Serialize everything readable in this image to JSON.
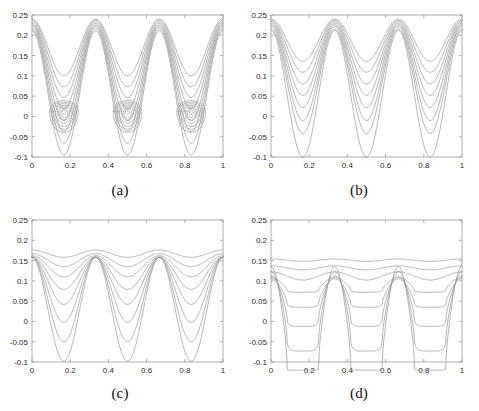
{
  "figure": {
    "title": "",
    "background_color": "#ffffff",
    "curve_color": "#8d8d8d",
    "axis_color": "#9a9a9a"
  },
  "panels": [
    {
      "id": "panel-a",
      "caption": "(a)",
      "x": 0,
      "y": 0,
      "w": 240,
      "h": 206
    },
    {
      "id": "panel-b",
      "caption": "(b)",
      "x": 239,
      "y": 0,
      "w": 240,
      "h": 206
    },
    {
      "id": "panel-c",
      "caption": "(c)",
      "x": 0,
      "y": 205,
      "w": 240,
      "h": 206
    },
    {
      "id": "panel-d",
      "caption": "(d)",
      "x": 239,
      "y": 205,
      "w": 240,
      "h": 206
    }
  ],
  "chart_data": [
    {
      "type": "line",
      "panel": "(a)",
      "title": "",
      "xlabel": "",
      "ylabel": "",
      "xlim": [
        0,
        1
      ],
      "ylim": [
        -0.1,
        0.25
      ],
      "xticks": [
        0,
        0.2,
        0.4,
        0.6,
        0.8,
        1
      ],
      "xticklabels": [
        "0",
        "0.2",
        "0.4",
        "0.6",
        "0.8",
        "1"
      ],
      "yticks": [
        -0.1,
        -0.05,
        0,
        0.05,
        0.1,
        0.15,
        0.2,
        0.25
      ],
      "yticklabels": [
        "-0.1",
        "-0.05",
        "0",
        "0.05",
        "0.1",
        "0.15",
        "0.2",
        "0.25"
      ],
      "grid": false,
      "legend": "none",
      "description": "Family of 8 nested periodic curves (period 1/3) with maxima near 0.24 and minima descending from 0.10 to -0.10, plus an inner family of small nested arcs inside each valley centered near y=0.01",
      "series": [
        {
          "name": "k1",
          "type": "cos3",
          "baseline": 0.17,
          "amplitude": 0.07,
          "peak": 0.24,
          "trough": 0.1
        },
        {
          "name": "k2",
          "type": "cos3",
          "baseline": 0.155,
          "amplitude": 0.082,
          "peak": 0.237,
          "trough": 0.073
        },
        {
          "name": "k3",
          "type": "cos3",
          "baseline": 0.14,
          "amplitude": 0.093,
          "peak": 0.233,
          "trough": 0.047
        },
        {
          "name": "k4",
          "type": "cos3",
          "baseline": 0.124,
          "amplitude": 0.105,
          "peak": 0.229,
          "trough": 0.019
        },
        {
          "name": "k5",
          "type": "cos3",
          "baseline": 0.108,
          "amplitude": 0.117,
          "peak": 0.225,
          "trough": -0.009
        },
        {
          "name": "k6",
          "type": "cos3",
          "baseline": 0.092,
          "amplitude": 0.129,
          "peak": 0.221,
          "trough": -0.037
        },
        {
          "name": "k7",
          "type": "cos3",
          "baseline": 0.075,
          "amplitude": 0.141,
          "peak": 0.216,
          "trough": -0.066
        },
        {
          "name": "k8",
          "type": "cos3",
          "baseline": 0.058,
          "amplitude": 0.153,
          "peak": 0.211,
          "trough": -0.095
        }
      ],
      "inner_arcs": {
        "centers_x": [
          0.1667,
          0.5,
          0.8333
        ],
        "center_y": 0.012,
        "count": 7,
        "max_half_width": 0.075,
        "max_half_height": 0.03
      }
    },
    {
      "type": "line",
      "panel": "(b)",
      "title": "",
      "xlabel": "",
      "ylabel": "",
      "xlim": [
        0,
        1
      ],
      "ylim": [
        -0.1,
        0.25
      ],
      "xticks": [
        0,
        0.2,
        0.4,
        0.6,
        0.8,
        1
      ],
      "xticklabels": [
        "0",
        "0.2",
        "0.4",
        "0.6",
        "0.8",
        "1"
      ],
      "yticks": [
        -0.1,
        -0.05,
        0,
        0.05,
        0.1,
        0.15,
        0.2,
        0.25
      ],
      "yticklabels": [
        "-0.1",
        "-0.05",
        "0",
        "0.05",
        "0.1",
        "0.15",
        "0.2",
        "0.25"
      ],
      "grid": false,
      "legend": "none",
      "description": "Family of 8 nested periodic curves (period 1/3); maxima shrink slightly from 0.240 to 0.210 while minima descend from 0.135 to -0.100",
      "series": [
        {
          "name": "k1",
          "type": "cos3",
          "baseline": 0.188,
          "amplitude": 0.052,
          "peak": 0.24,
          "trough": 0.136
        },
        {
          "name": "k2",
          "type": "cos3",
          "baseline": 0.173,
          "amplitude": 0.064,
          "peak": 0.237,
          "trough": 0.109
        },
        {
          "name": "k3",
          "type": "cos3",
          "baseline": 0.157,
          "amplitude": 0.077,
          "peak": 0.234,
          "trough": 0.08
        },
        {
          "name": "k4",
          "type": "cos3",
          "baseline": 0.141,
          "amplitude": 0.089,
          "peak": 0.23,
          "trough": 0.052
        },
        {
          "name": "k5",
          "type": "cos3",
          "baseline": 0.124,
          "amplitude": 0.102,
          "peak": 0.226,
          "trough": 0.022
        },
        {
          "name": "k6",
          "type": "cos3",
          "baseline": 0.106,
          "amplitude": 0.116,
          "peak": 0.222,
          "trough": -0.01
        },
        {
          "name": "k7",
          "type": "cos3",
          "baseline": 0.087,
          "amplitude": 0.129,
          "peak": 0.216,
          "trough": -0.042
        },
        {
          "name": "k8",
          "type": "cos3",
          "baseline": 0.056,
          "amplitude": 0.156,
          "peak": 0.212,
          "trough": -0.1
        }
      ]
    },
    {
      "type": "line",
      "panel": "(c)",
      "title": "",
      "xlabel": "",
      "ylabel": "",
      "xlim": [
        0,
        1
      ],
      "ylim": [
        -0.1,
        0.25
      ],
      "xticks": [
        0,
        0.2,
        0.4,
        0.6,
        0.8,
        1
      ],
      "xticklabels": [
        "0",
        "0.2",
        "0.4",
        "0.6",
        "0.8",
        "1"
      ],
      "yticks": [
        -0.1,
        -0.05,
        0,
        0.05,
        0.1,
        0.15,
        0.2,
        0.25
      ],
      "yticklabels": [
        "-0.1",
        "-0.05",
        "0",
        "0.05",
        "0.1",
        "0.15",
        "0.2",
        "0.25"
      ],
      "grid": false,
      "legend": "none",
      "description": "Family of 8 periodic curves (period 1/3) whose amplitude grows from nearly flat at 0.168 down to a deep oscillation reaching -0.098; all curves cross near x=0 at about 0.10",
      "series": [
        {
          "name": "k1",
          "type": "cos3",
          "baseline": 0.167,
          "amplitude": 0.009,
          "peak": 0.176,
          "trough": 0.158
        },
        {
          "name": "k2",
          "type": "cos3",
          "baseline": 0.151,
          "amplitude": 0.016,
          "peak": 0.167,
          "trough": 0.135
        },
        {
          "name": "k3",
          "type": "cos3",
          "baseline": 0.136,
          "amplitude": 0.026,
          "peak": 0.162,
          "trough": 0.11
        },
        {
          "name": "k4",
          "type": "cos3",
          "baseline": 0.119,
          "amplitude": 0.04,
          "peak": 0.159,
          "trough": 0.079
        },
        {
          "name": "k5",
          "type": "cos3",
          "baseline": 0.1,
          "amplitude": 0.058,
          "peak": 0.158,
          "trough": 0.042
        },
        {
          "name": "k6",
          "type": "cos3",
          "baseline": 0.078,
          "amplitude": 0.08,
          "peak": 0.158,
          "trough": -0.002
        },
        {
          "name": "k7",
          "type": "cos3",
          "baseline": 0.054,
          "amplitude": 0.104,
          "peak": 0.158,
          "trough": -0.05
        },
        {
          "name": "k8",
          "type": "cos3",
          "baseline": 0.03,
          "amplitude": 0.128,
          "peak": 0.158,
          "trough": -0.098
        }
      ]
    },
    {
      "type": "line",
      "panel": "(d)",
      "title": "",
      "xlabel": "",
      "ylabel": "",
      "xlim": [
        0,
        1
      ],
      "ylim": [
        -0.1,
        0.25
      ],
      "xticks": [
        0,
        0.2,
        0.4,
        0.6,
        0.8,
        1
      ],
      "xticklabels": [
        "0",
        "0.2",
        "0.4",
        "0.6",
        "0.8",
        "1"
      ],
      "yticks": [
        -0.1,
        -0.05,
        0,
        0.05,
        0.1,
        0.15,
        0.2,
        0.25
      ],
      "yticklabels": [
        "-0.1",
        "-0.05",
        "0",
        "0.05",
        "0.1",
        "0.15",
        "0.2",
        "0.25"
      ],
      "grid": false,
      "legend": "none",
      "description": "Family of 8 periodic curves (period 1/3); upper curves are nearly flat lines at 0.152, 0.133 and 0.113 while lower curves develop sharp narrow valleys reaching -0.100, all sharing peaks near 0.10",
      "series": [
        {
          "name": "k1",
          "type": "cos3",
          "baseline": 0.151,
          "amplitude": 0.003,
          "peak": 0.154,
          "trough": 0.148
        },
        {
          "name": "k2",
          "type": "cos3",
          "baseline": 0.132,
          "amplitude": 0.005,
          "peak": 0.137,
          "trough": 0.127
        },
        {
          "name": "k3",
          "type": "cos3",
          "baseline": 0.112,
          "amplitude": 0.01,
          "peak": 0.122,
          "trough": 0.102
        },
        {
          "name": "k4",
          "type": "cos3sharp",
          "baseline": 0.09,
          "amplitude": 0.018,
          "peak": 0.104,
          "trough": 0.072
        },
        {
          "name": "k5",
          "type": "cos3sharp",
          "baseline": 0.07,
          "amplitude": 0.035,
          "peak": 0.1,
          "trough": 0.048
        },
        {
          "name": "k6",
          "type": "cos3sharp",
          "baseline": 0.05,
          "amplitude": 0.062,
          "peak": 0.1,
          "trough": 0.018
        },
        {
          "name": "k7",
          "type": "cos3sharp",
          "baseline": 0.025,
          "amplitude": 0.098,
          "peak": 0.1,
          "trough": -0.034
        },
        {
          "name": "k8",
          "type": "cos3sharp",
          "baseline": -0.005,
          "amplitude": 0.14,
          "peak": 0.1,
          "trough": -0.1
        }
      ]
    }
  ]
}
